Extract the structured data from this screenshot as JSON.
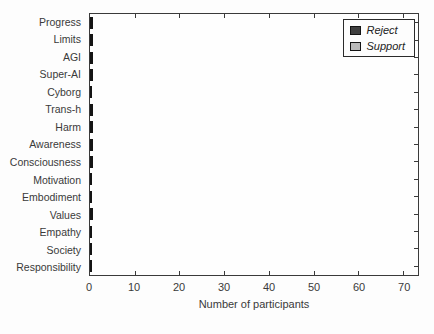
{
  "chart_data": {
    "type": "bar",
    "orientation": "horizontal",
    "stacked": true,
    "title": "",
    "xlabel": "Number of participants",
    "xlim": [
      0,
      73.3
    ],
    "xticks": [
      0,
      10,
      20,
      30,
      40,
      50,
      60,
      70
    ],
    "grid": false,
    "legend_position": "top-right",
    "categories": [
      "Progress",
      "Limits",
      "AGI",
      "Super-AI",
      "Cyborg",
      "Trans-h",
      "Harm",
      "Awareness",
      "Consciousness",
      "Motivation",
      "Embodiment",
      "Values",
      "Empathy",
      "Society",
      "Responsibility"
    ],
    "series": [
      {
        "name": "Reject",
        "color": "#3f3f3f",
        "values": [
          9,
          4,
          16,
          26,
          0,
          1,
          27,
          1,
          1,
          0,
          0,
          1,
          0,
          0,
          0
        ]
      },
      {
        "name": "Support",
        "color": "#b9b9b9",
        "values": [
          12,
          33,
          7,
          13,
          5,
          1,
          40,
          5,
          3,
          11,
          10,
          20,
          11,
          19,
          31
        ]
      }
    ],
    "colors": {
      "axis": "#3a3a3a",
      "background": "#fdfdfd",
      "bar_border": "#141414"
    }
  }
}
